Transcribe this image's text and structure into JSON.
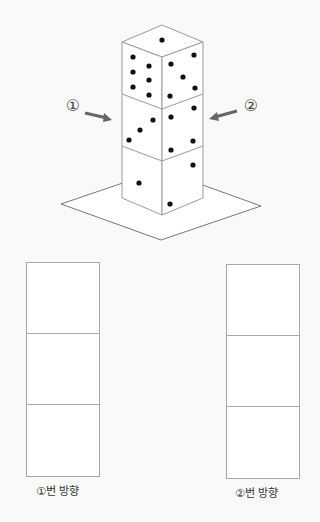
{
  "diagram": {
    "tower": {
      "cubes": 3,
      "stroke": "#9a9a9a",
      "dot_color": "#111111"
    },
    "arrows": [
      {
        "label": "①",
        "direction": "from-left"
      },
      {
        "label": "②",
        "direction": "from-right"
      }
    ],
    "answer_grids": [
      {
        "caption": "①번 방향",
        "cells": 3
      },
      {
        "caption": "②번 방향",
        "cells": 3
      }
    ]
  }
}
